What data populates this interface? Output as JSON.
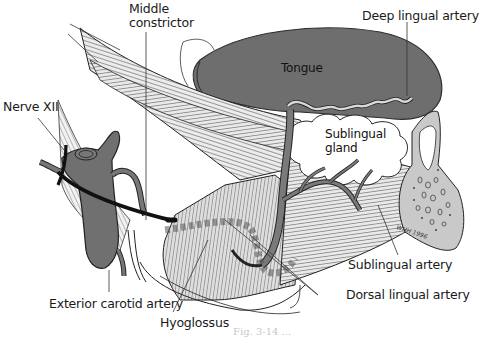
{
  "figure": {
    "labels": {
      "middle_constrictor_line1": "Middle",
      "middle_constrictor_line2": "constrictor",
      "deep_lingual_artery": "Deep lingual artery",
      "tongue": "Tongue",
      "nerve_xii": "Nerve XII",
      "sublingual_gland_line1": "Sublingual",
      "sublingual_gland_line2": "gland",
      "sublingual_artery": "Sublingual artery",
      "dorsal_lingual_artery": "Dorsal lingual artery",
      "exterior_carotid_artery": "Exterior carotid artery",
      "hyoglossus": "Hyoglossus"
    },
    "signature": "WHH 1996",
    "caption_fragment": "Fig. 3-14 ..."
  },
  "colors": {
    "tongue": "#6e6e6e",
    "artery": "#7a7a7a",
    "muscle_fill": "#e4e4e4",
    "muscle_stroke": "#2a2a2a",
    "gland": "#ffffff",
    "bone": "#c9c9c9",
    "nerve": "#111111",
    "background": "#ffffff"
  }
}
